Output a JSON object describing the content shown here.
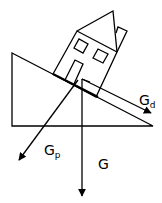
{
  "diagram": {
    "type": "physics-free-body",
    "colors": {
      "stroke": "#000000",
      "background": "#ffffff"
    },
    "labels": {
      "gd": {
        "base": "G",
        "sub": "d"
      },
      "gp": {
        "base": "G",
        "sub": "p"
      },
      "g": {
        "base": "G"
      }
    }
  }
}
